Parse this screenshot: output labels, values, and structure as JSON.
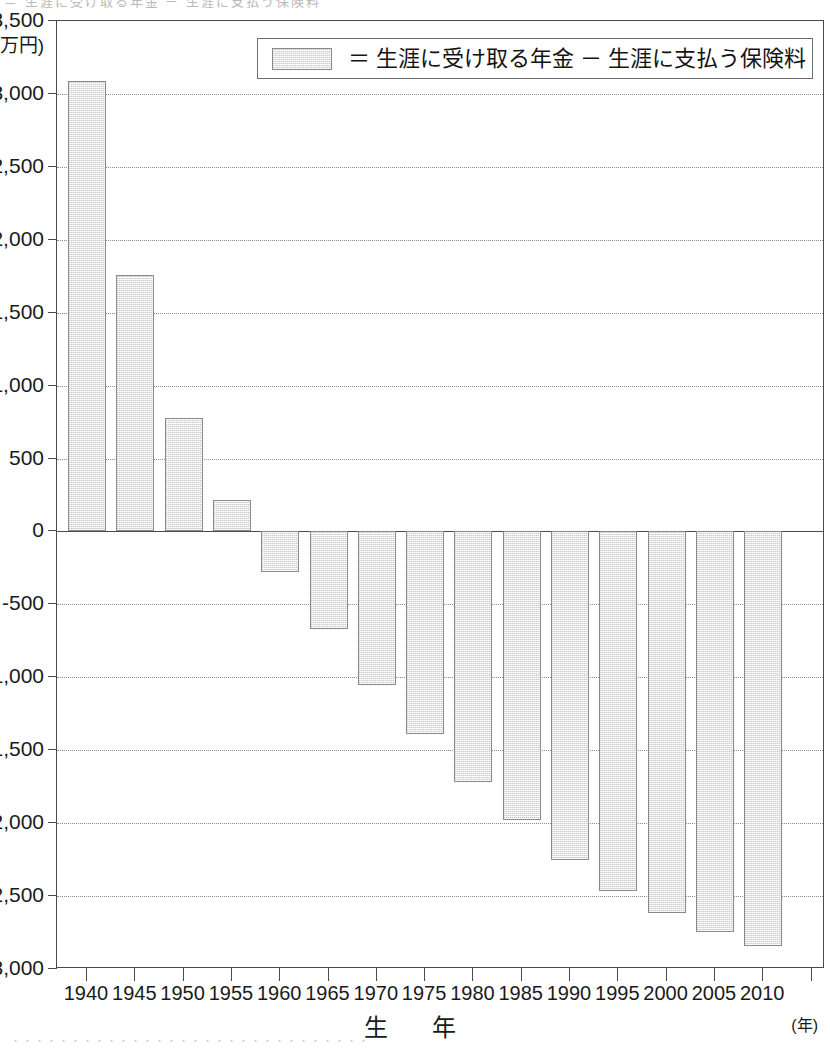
{
  "figure": {
    "y_unit_label": "(万円)",
    "x_axis_title": "生　年",
    "x_axis_unit": "(年)",
    "scan_artifact_top": "＝ 生涯に受け取る年金 － 生涯に支払う保険料",
    "scan_artifact_bottom": "・・・・・・・・・・・・・・・・・・・・・・・・・・・・・・"
  },
  "legend": {
    "marker": "bar-swatch",
    "text": "＝ 生涯に受け取る年金 － 生涯に支払う保険料"
  },
  "colors": {
    "bar_fill": "#e6e6e6",
    "bar_border": "#8a8a8a",
    "axis": "#4a4a4a",
    "gridline": "#8b8b8b",
    "text": "#1a1a1a"
  },
  "chart_data": {
    "type": "bar",
    "title": "",
    "subtitle": "",
    "xlabel": "生　年",
    "ylabel": "(万円)",
    "ylim": [
      -3000,
      3500
    ],
    "ytick_step": 500,
    "yticks": [
      3500,
      3000,
      2500,
      2000,
      1500,
      1000,
      500,
      0,
      -500,
      -1000,
      -1500,
      -2000,
      -2500,
      -3000
    ],
    "ytick_labels": [
      "3,500",
      "3,000",
      "2,500",
      "2,000",
      "1,500",
      "1,000",
      "500",
      "0",
      "-500",
      "-1,000",
      "-1,500",
      "-2,000",
      "-2,500",
      "-3,000"
    ],
    "grid": true,
    "grid_axis": "y",
    "legend_position": "top-center",
    "legend_entries": [
      "生涯に受け取る年金 － 生涯に支払う保険料"
    ],
    "categories": [
      "1940",
      "1945",
      "1950",
      "1955",
      "1960",
      "1965",
      "1970",
      "1975",
      "1980",
      "1985",
      "1990",
      "1995",
      "2000",
      "2005",
      "2010"
    ],
    "values": [
      3090,
      1760,
      775,
      215,
      -275,
      -670,
      -1050,
      -1390,
      -1720,
      -1980,
      -2250,
      -2465,
      -2615,
      -2745,
      -2845
    ],
    "series": [
      {
        "name": "生涯に受け取る年金 － 生涯に支払う保険料",
        "values": [
          3090,
          1760,
          775,
          215,
          -275,
          -670,
          -1050,
          -1390,
          -1720,
          -1980,
          -2250,
          -2465,
          -2615,
          -2745,
          -2845
        ]
      }
    ]
  }
}
